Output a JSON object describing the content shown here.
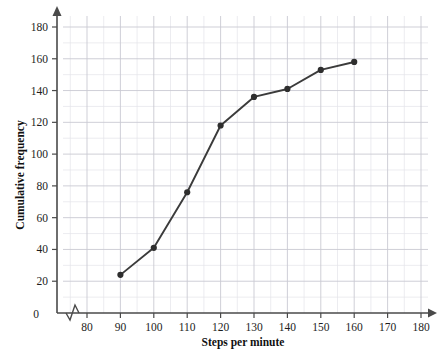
{
  "chart_data": {
    "type": "line",
    "title": "",
    "subtitle": "",
    "xlabel": "Steps per minute",
    "ylabel": "Cumulative frequency",
    "x": [
      90,
      100,
      110,
      120,
      130,
      140,
      150,
      160
    ],
    "values": [
      24,
      41,
      76,
      118,
      136,
      141,
      153,
      158
    ],
    "series": [
      {
        "name": "Cumulative frequency",
        "x": [
          90,
          100,
          110,
          120,
          130,
          140,
          150,
          160
        ],
        "values": [
          24,
          41,
          76,
          118,
          136,
          141,
          153,
          158
        ]
      }
    ],
    "xlim": [
      75,
      185
    ],
    "ylim": [
      0,
      188
    ],
    "xticks": [
      80,
      90,
      100,
      110,
      120,
      130,
      140,
      150,
      160,
      170,
      180
    ],
    "xtick_labels": [
      "80",
      "90",
      "100",
      "110",
      "120",
      "130",
      "140",
      "150",
      "160",
      "170",
      "180"
    ],
    "yticks": [
      0,
      20,
      40,
      60,
      80,
      100,
      120,
      140,
      160,
      180
    ],
    "ytick_labels": [
      "0",
      "20",
      "40",
      "60",
      "80",
      "100",
      "120",
      "140",
      "160",
      "180"
    ],
    "grid": true,
    "minor_grid": true,
    "legend": false,
    "legend_position": "none",
    "axis_break": {
      "axis": "x",
      "present": true,
      "note": "zigzag break between origin and first tick"
    },
    "marker": "filled-circle",
    "annotations": []
  },
  "style": {
    "series_color": "#3b3b3b",
    "marker_color": "#2e2e2e",
    "axis_color": "#4a4a4a",
    "grid_major_color": "#c9c9d2",
    "grid_minor_color": "#e4e4ea",
    "text_color": "#1d1d1d",
    "background": "#ffffff"
  },
  "labels": {
    "x_axis_title": "Steps per minute",
    "y_axis_title": "Cumulative frequency",
    "origin_label": "0"
  }
}
